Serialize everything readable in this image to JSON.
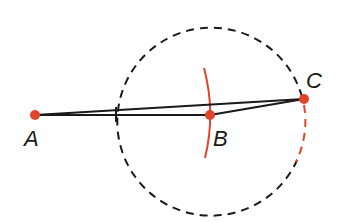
{
  "diagram": {
    "type": "geometric-construction",
    "colors": {
      "line": "#1a1a1a",
      "accent": "#e0442a"
    },
    "points": [
      {
        "label": "A",
        "x": 35,
        "y": 115
      },
      {
        "label": "B",
        "x": 210,
        "y": 115
      },
      {
        "label": "C",
        "x": 304,
        "y": 99
      }
    ],
    "circle": {
      "center": "B",
      "cx": 210,
      "cy": 115,
      "r": 94,
      "style": "dashed"
    },
    "segments": [
      "AB",
      "AC",
      "BC"
    ],
    "arc": {
      "through": "B",
      "color": "red"
    }
  }
}
